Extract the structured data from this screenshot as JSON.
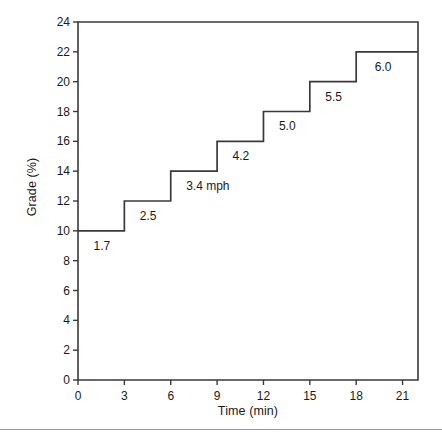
{
  "chart_data": {
    "type": "line",
    "title": "",
    "subtitle": "",
    "xlabel": "Time (min)",
    "ylabel": "Grade (%)",
    "xlim": [
      0,
      22
    ],
    "ylim": [
      0,
      24
    ],
    "xticks": [
      0,
      3,
      6,
      9,
      12,
      15,
      18,
      21
    ],
    "xtick_labels": [
      "0",
      "3",
      "6",
      "9",
      "12",
      "15",
      "18",
      "21"
    ],
    "yticks": [
      0,
      2,
      4,
      6,
      8,
      10,
      12,
      14,
      16,
      18,
      20,
      22,
      24
    ],
    "ytick_labels": [
      "0",
      "2",
      "4",
      "6",
      "8",
      "10",
      "12",
      "14",
      "16",
      "18",
      "20",
      "22",
      "24"
    ],
    "grid": false,
    "legend": "none",
    "drawstyle": "steps-post",
    "x": [
      0,
      3,
      6,
      9,
      12,
      15,
      18,
      21,
      22
    ],
    "values": [
      10,
      12,
      14,
      16,
      18,
      20,
      22,
      22,
      22
    ],
    "series": [
      {
        "name": "Grade (%)",
        "x": [
          0,
          3,
          6,
          9,
          12,
          15,
          18,
          21,
          22
        ],
        "values": [
          10,
          12,
          14,
          16,
          18,
          20,
          22,
          22,
          22
        ],
        "color": "#3a3a3a"
      }
    ],
    "stages": [
      {
        "start_min": 0,
        "end_min": 3,
        "grade": 10,
        "speed_label": "1.7"
      },
      {
        "start_min": 3,
        "end_min": 6,
        "grade": 12,
        "speed_label": "2.5"
      },
      {
        "start_min": 6,
        "end_min": 9,
        "grade": 14,
        "speed_label": "3.4 mph"
      },
      {
        "start_min": 9,
        "end_min": 12,
        "grade": 16,
        "speed_label": "4.2"
      },
      {
        "start_min": 12,
        "end_min": 15,
        "grade": 18,
        "speed_label": "5.0"
      },
      {
        "start_min": 15,
        "end_min": 18,
        "grade": 20,
        "speed_label": "5.5"
      },
      {
        "start_min": 18,
        "end_min": 22,
        "grade": 22,
        "speed_label": "6.0"
      }
    ],
    "annotations": [
      {
        "text": "1.7",
        "x_min": 1.0,
        "y_grade": 9.0
      },
      {
        "text": "2.5",
        "x_min": 4.0,
        "y_grade": 11.0
      },
      {
        "text": "3.4 mph",
        "x_min": 7.0,
        "y_grade": 13.0
      },
      {
        "text": "4.2",
        "x_min": 10.0,
        "y_grade": 15.0
      },
      {
        "text": "5.0",
        "x_min": 13.0,
        "y_grade": 17.0
      },
      {
        "text": "5.5",
        "x_min": 16.0,
        "y_grade": 19.0
      },
      {
        "text": "6.0",
        "x_min": 19.2,
        "y_grade": 21.0
      }
    ]
  },
  "footer": {
    "caption": ""
  }
}
